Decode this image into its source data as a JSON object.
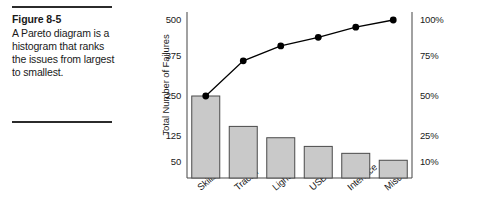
{
  "figure": {
    "label": "Figure 8-5",
    "caption": "A Pareto diagram is a histogram that ranks the issues from largest to smallest."
  },
  "chart_data": {
    "type": "bar",
    "title": "",
    "subtitle": "",
    "xlabel": "",
    "ylabel": "Total Number of Failures",
    "y2label": "",
    "categories": [
      "Skills",
      "Tractor",
      "Light",
      "USB",
      "Interface",
      "Misc"
    ],
    "series": [
      {
        "name": "Total Number of Failures",
        "type": "bar",
        "axis": "left",
        "values": [
          250,
          155,
          120,
          95,
          75,
          55
        ],
        "color": "#c9c9c9",
        "edge_color": "#4a4a4a"
      },
      {
        "name": "Cumulative Percentage",
        "type": "line",
        "axis": "right",
        "values": [
          50,
          72,
          82,
          88,
          95,
          100
        ],
        "color": "#000000",
        "marker": "circle"
      }
    ],
    "yticks": [
      50,
      125,
      250,
      375,
      500
    ],
    "ytick_labels": [
      "50",
      "125",
      "250",
      "375",
      "500"
    ],
    "y2ticks": [
      10,
      25,
      50,
      75,
      100
    ],
    "y2tick_labels": [
      "10%",
      "25%",
      "50%",
      "75%",
      "100%"
    ],
    "ylim": [
      0,
      500
    ],
    "y2lim": [
      0,
      100
    ],
    "grid": false,
    "legend": "none"
  }
}
